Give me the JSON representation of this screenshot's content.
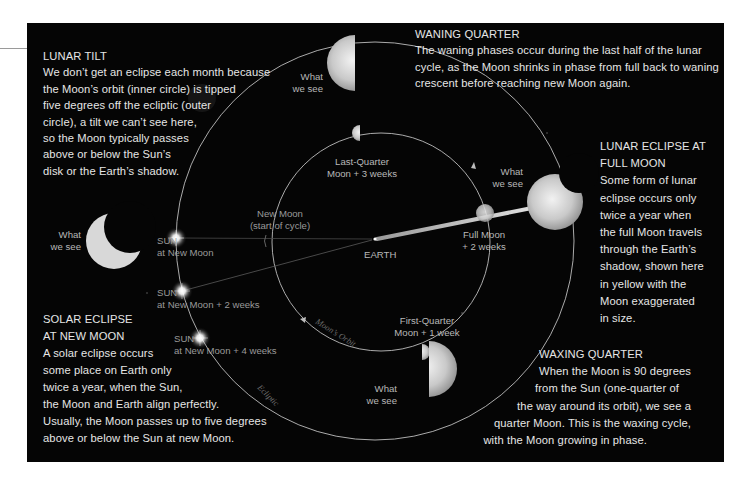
{
  "colors": {
    "background": "#050505",
    "text": "#e6e6e6",
    "label": "#b8b8b8",
    "orbit_line": "#cfcfcf",
    "shadow_beam": "#d8d8d8"
  },
  "sections": {
    "lunar_tilt": {
      "heading": "LUNAR TILT",
      "lines": [
        "We don’t get an eclipse each month because",
        "the Moon’s orbit (inner circle) is tipped",
        "five degrees off the ecliptic (outer",
        "circle), a tilt we can’t see here,",
        "so the Moon typically passes",
        "above or below the Sun’s",
        "disk or the Earth’s shadow."
      ]
    },
    "waning_quarter": {
      "heading": "WANING QUARTER",
      "lines": [
        "The waning phases occur during the last half of the lunar",
        "cycle, as the Moon shrinks in phase from full back to waning",
        "crescent before reaching new Moon again."
      ]
    },
    "lunar_eclipse": {
      "heading_lines": [
        "LUNAR ECLIPSE AT",
        "FULL MOON"
      ],
      "lines": [
        "Some form of lunar",
        "eclipse occurs only",
        "twice a year when",
        "the full Moon travels",
        "through the Earth’s",
        "shadow, shown here",
        "in yellow with the",
        "Moon exaggerated",
        "in size."
      ]
    },
    "solar_eclipse": {
      "heading_lines": [
        "SOLAR ECLIPSE",
        "AT NEW MOON"
      ],
      "lines": [
        "A solar eclipse occurs",
        "some place on Earth only",
        "twice a year, when the Sun,",
        "the Moon and Earth align perfectly.",
        "Usually, the Moon passes up to five degrees",
        "above or below the Sun at new Moon."
      ]
    },
    "waxing_quarter": {
      "heading": "WAXING QUARTER",
      "lines": [
        "When the Moon is 90 degrees",
        "from the Sun (one-quarter of",
        "the way around its orbit), we see a",
        "quarter Moon. This is the waxing cycle,",
        "with the Moon growing in phase."
      ]
    }
  },
  "labels": {
    "what_we_see": [
      "What",
      "we see"
    ],
    "last_quarter": [
      "Last-Quarter",
      "Moon + 3 weeks"
    ],
    "new_moon": [
      "New Moon",
      "(start of cycle)"
    ],
    "full_moon": [
      "Full Moon",
      "+ 2 weeks"
    ],
    "first_quarter": [
      "First-Quarter",
      "Moon + 1 week"
    ],
    "earth": "EARTH",
    "sun_word": "SUN",
    "sun_positions": [
      "at New Moon",
      "at New Moon + 2 weeks",
      "at New Moon + 4 weeks"
    ],
    "moons_orbit": "Moon’s Orbit",
    "ecliptic": "Ecliptic"
  }
}
